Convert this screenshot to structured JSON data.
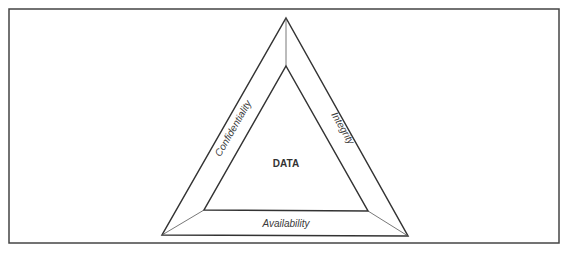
{
  "diagram": {
    "type": "cia-triad",
    "center_label": "DATA",
    "sides": [
      {
        "position": "left",
        "label": "Confidentiality"
      },
      {
        "position": "right",
        "label": "Integrity"
      },
      {
        "position": "bottom",
        "label": "Availability"
      }
    ],
    "colors": {
      "line": "#333333",
      "text": "#3a3a3a",
      "background": "#ffffff"
    }
  }
}
